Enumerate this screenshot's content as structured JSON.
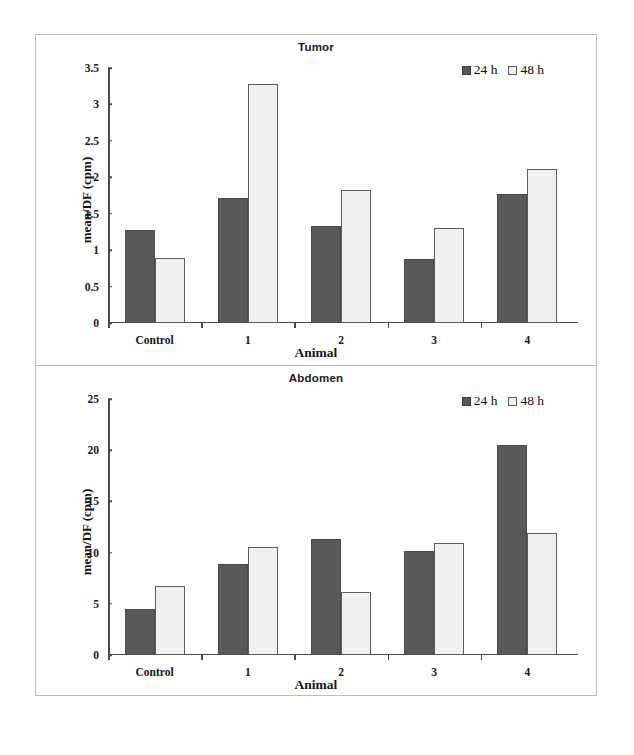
{
  "figure": {
    "background_color": "#fdfdfc",
    "frame_color": "#bdbdbd",
    "series_colors": {
      "24 h": "#595959",
      "48 h": "#f0f0f0"
    }
  },
  "chart_data": [
    {
      "type": "bar",
      "title": "Tumor",
      "xlabel": "Animal",
      "ylabel": "mean/DF (cpm)",
      "categories": [
        "Control",
        "1",
        "2",
        "3",
        "4"
      ],
      "series": [
        {
          "name": "24 h",
          "values": [
            1.28,
            1.71,
            1.33,
            0.88,
            1.77
          ]
        },
        {
          "name": "48 h",
          "values": [
            0.89,
            3.28,
            1.82,
            1.3,
            2.12
          ]
        }
      ],
      "ylim": [
        0,
        3.5
      ],
      "yticks": [
        "0",
        "0.5",
        "1",
        "1.5",
        "2",
        "2.5",
        "3",
        "3.5"
      ],
      "ytick_values": [
        0,
        0.5,
        1,
        1.5,
        2,
        2.5,
        3,
        3.5
      ],
      "grid": false,
      "legend": [
        "24 h",
        "48 h"
      ],
      "legend_position": "top-right"
    },
    {
      "type": "bar",
      "title": "Abdomen",
      "xlabel": "Animal",
      "ylabel": "mean/DF (cpm)",
      "categories": [
        "Control",
        "1",
        "2",
        "3",
        "4"
      ],
      "series": [
        {
          "name": "24 h",
          "values": [
            4.5,
            8.9,
            11.3,
            10.2,
            20.5
          ]
        },
        {
          "name": "48 h",
          "values": [
            6.7,
            10.5,
            6.2,
            10.9,
            11.9
          ]
        }
      ],
      "ylim": [
        0,
        25
      ],
      "yticks": [
        "0",
        "5",
        "10",
        "15",
        "20",
        "25"
      ],
      "ytick_values": [
        0,
        5,
        10,
        15,
        20,
        25
      ],
      "grid": false,
      "legend": [
        "24 h",
        "48 h"
      ],
      "legend_position": "top-right"
    }
  ]
}
